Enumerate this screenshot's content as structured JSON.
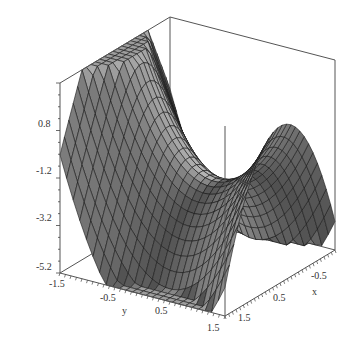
{
  "chart_data": {
    "type": "surface3d",
    "title": "",
    "xlabel": "x",
    "ylabel": "y",
    "zlabel": "",
    "x_range": [
      -1.5,
      1.5
    ],
    "y_range": [
      -1.5,
      1.5
    ],
    "z_range": [
      -5.2,
      2.8
    ],
    "x_ticks": [
      "-0.5",
      "0.5",
      "1.5"
    ],
    "y_ticks": [
      "-1.5",
      "-0.5",
      "0.5",
      "1.5"
    ],
    "z_ticks": [
      "0.8",
      "-1.2",
      "-3.2",
      "-5.2"
    ],
    "grid_resolution": 25,
    "surface_style": "gray shaded surface with black wireframe mesh",
    "box": "bounding box with axes on front edges",
    "shape_description": "Saddle-like surface with ripples: high ridge along back-left (y=-1.5 side) reaching top of box, a central saddle near (0,0), two arch-shaped humps on the x side descending to the bottom of the box at y=1.5 corners"
  },
  "colors": {
    "surface_dark": "#5a5a5a",
    "surface_light": "#b8b8b8",
    "mesh": "#1a1a1a",
    "box": "#555555",
    "background": "#ffffff"
  }
}
